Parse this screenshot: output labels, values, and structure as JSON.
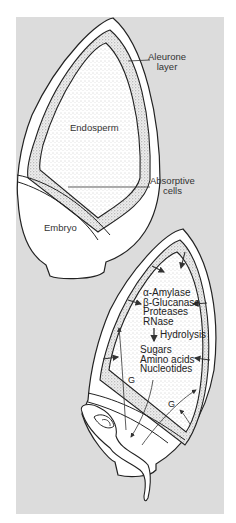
{
  "figure": {
    "colors": {
      "background": "#dcdcdc",
      "page": "#ffffff",
      "outline": "#222222",
      "tissue_fill": "#ffffff",
      "stipple": "#9a9a9a"
    }
  },
  "upper_grain": {
    "labels": {
      "aleurone_line1": "Aleurone",
      "aleurone_line2": "layer",
      "endosperm": "Endosperm",
      "absorptive_line1": "Absorptive",
      "absorptive_line2": "cells",
      "embryo": "Embryo"
    }
  },
  "lower_grain": {
    "enzymes": [
      "α-Amylase",
      "β-Glucanase",
      "Proteases",
      "RNase"
    ],
    "process": "Hydrolysis",
    "products": [
      "Sugars",
      "Amino acids",
      "Nucleotides"
    ],
    "signal_labels": [
      "G",
      "G"
    ]
  }
}
